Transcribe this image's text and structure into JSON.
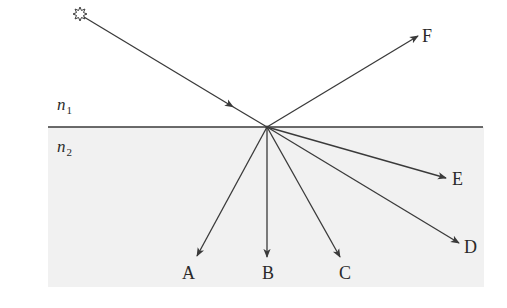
{
  "diagram": {
    "type": "light reflection and refraction at an interface",
    "colors": {
      "line": "#3a3a3a",
      "medium2_fill": "#f1f1f1",
      "background": "#ffffff"
    },
    "interface": {
      "x1": 48,
      "y1": 127,
      "x2": 483,
      "y2": 127
    },
    "medium2_region": {
      "x": 48,
      "y": 127,
      "width": 436,
      "height": 160
    },
    "incidence_point": {
      "x": 267,
      "y": 127
    },
    "media": [
      {
        "id": "n1",
        "symbol": "n",
        "subscript": "1",
        "x": 57,
        "y": 110
      },
      {
        "id": "n2",
        "symbol": "n",
        "subscript": "2",
        "x": 57,
        "y": 152
      }
    ],
    "source": {
      "name": "light source (star)",
      "x": 80,
      "y": 14,
      "glyph": "✲"
    },
    "incident_ray": {
      "from": {
        "x": 84,
        "y": 17
      },
      "to": {
        "x": 267,
        "y": 127
      },
      "arrow_at": {
        "x": 230,
        "y": 105
      }
    },
    "rays": [
      {
        "label": "F",
        "end": {
          "x": 418,
          "y": 36
        },
        "label_pos": {
          "x": 422,
          "y": 42
        },
        "kind": "reflected"
      },
      {
        "label": "A",
        "end": {
          "x": 197,
          "y": 256
        },
        "label_pos": {
          "x": 182,
          "y": 279
        },
        "kind": "refracted"
      },
      {
        "label": "B",
        "end": {
          "x": 267,
          "y": 257
        },
        "label_pos": {
          "x": 262,
          "y": 279
        },
        "kind": "refracted"
      },
      {
        "label": "C",
        "end": {
          "x": 340,
          "y": 257
        },
        "label_pos": {
          "x": 339,
          "y": 279
        },
        "kind": "refracted"
      },
      {
        "label": "D",
        "end": {
          "x": 459,
          "y": 243
        },
        "label_pos": {
          "x": 464,
          "y": 253
        },
        "kind": "refracted"
      },
      {
        "label": "E",
        "end": {
          "x": 446,
          "y": 178
        },
        "label_pos": {
          "x": 452,
          "y": 185
        },
        "kind": "refracted"
      }
    ]
  }
}
